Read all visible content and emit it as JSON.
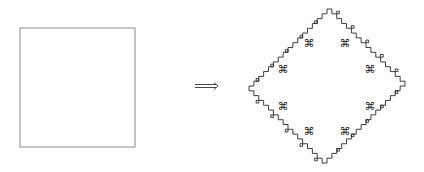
{
  "figure": {
    "left_shape": {
      "type": "square",
      "x": 20,
      "y": 28,
      "width": 115,
      "height": 119,
      "stroke": "#8a8a8a"
    },
    "arrow": {
      "symbol": "⟹",
      "x": 195,
      "y": 86,
      "width": 23
    },
    "right_shape": {
      "type": "fractal-diamond",
      "center_x": 327,
      "center_y": 86,
      "half_width": 78,
      "half_height": 77,
      "stroke": "#2a2a2a",
      "motif_symbol": "⌘",
      "motifs": [
        {
          "x": 309,
          "y": 43
        },
        {
          "x": 345,
          "y": 43
        },
        {
          "x": 283,
          "y": 69
        },
        {
          "x": 370,
          "y": 69
        },
        {
          "x": 283,
          "y": 106
        },
        {
          "x": 370,
          "y": 106
        },
        {
          "x": 309,
          "y": 131
        },
        {
          "x": 345,
          "y": 131
        }
      ]
    }
  }
}
